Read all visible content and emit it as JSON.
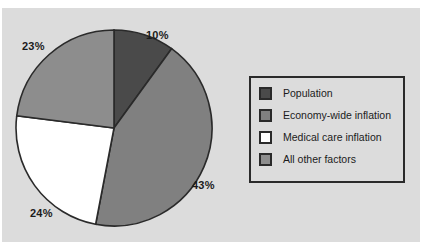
{
  "chart_data": {
    "type": "pie",
    "title": "",
    "subtitle": "",
    "xlabel": "",
    "ylabel": "",
    "legend_position": "right",
    "grid": false,
    "start_angle_oclock": 12,
    "direction": "clockwise",
    "categories": [
      "Population",
      "Economy-wide inflation",
      "Medical care inflation",
      "All other factors"
    ],
    "values": [
      10,
      43,
      24,
      23
    ],
    "value_labels": [
      "10%",
      "43%",
      "24%",
      "23%"
    ],
    "colors": [
      "#4a4a4a",
      "#808080",
      "#ffffff",
      "#8d8d8d"
    ],
    "slices": [
      {
        "label": "Population",
        "value": 10,
        "display": "10%",
        "color": "#4a4a4a"
      },
      {
        "label": "Economy-wide inflation",
        "value": 43,
        "display": "43%",
        "color": "#808080"
      },
      {
        "label": "Medical care inflation",
        "value": 24,
        "display": "24%",
        "color": "#ffffff"
      },
      {
        "label": "All other factors",
        "value": 23,
        "display": "23%",
        "color": "#8d8d8d"
      }
    ]
  },
  "pie": {
    "labels": {
      "population": "10%",
      "economy_wide_inflation": "43%",
      "medical_care_inflation": "24%",
      "all_other_factors": "23%"
    }
  },
  "legend": {
    "items": [
      {
        "label": "Population",
        "color": "#4a4a4a"
      },
      {
        "label": "Economy-wide inflation",
        "color": "#808080"
      },
      {
        "label": "Medical care inflation",
        "color": "#ffffff"
      },
      {
        "label": "All other factors",
        "color": "#8d8d8d"
      }
    ]
  },
  "style": {
    "panel_background": "#dcdcdc",
    "outline": "#2a2a2a",
    "text": "#1b1b1b"
  }
}
